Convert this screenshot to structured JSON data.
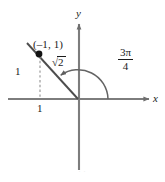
{
  "figure": {
    "kind": "unit-circle-angle-diagram",
    "axes": {
      "x_label": "x",
      "y_label": "y",
      "origin_px": [
        78,
        99
      ],
      "x_axis_from_px": [
        8,
        99
      ],
      "x_axis_to_px": [
        151,
        99
      ],
      "y_axis_from_px": [
        79,
        22
      ],
      "y_axis_to_px": [
        79,
        170
      ],
      "axis_color": "#808080",
      "arrowheads": [
        "x-positive",
        "y-positive"
      ]
    },
    "point": {
      "label": "(–1, 1)",
      "coordinates": [
        -1,
        1
      ],
      "marker_px": [
        39,
        54
      ],
      "marker_color": "#1a1a1a"
    },
    "terminal_ray": {
      "from_px": [
        78,
        99
      ],
      "to_px": [
        27,
        43
      ],
      "color": "#4a4a4a",
      "description": "terminal side through (-1, 1)"
    },
    "dashed_segment": {
      "label": "1",
      "from_px": [
        40,
        56
      ],
      "to_px": [
        40,
        99
      ],
      "style": "dashed",
      "color": "#9a9a9a",
      "description": "vertical drop from point to x-axis"
    },
    "leg_labels": {
      "vertical": "1",
      "horizontal": "1"
    },
    "hypotenuse_label": {
      "radical_symbol": "√",
      "radicand": "2",
      "text": "√2"
    },
    "angle": {
      "numerator": "3π",
      "denominator": "4",
      "text": "3π/4",
      "radians": 2.356,
      "degrees": 135,
      "arc_radius_px": 30,
      "arc_start_px": [
        108,
        99
      ],
      "arc_end_px": [
        61,
        72
      ],
      "arc_direction": "counterclockwise",
      "arc_color": "#6a6a6a"
    },
    "bottom_artifact": "· ·"
  }
}
